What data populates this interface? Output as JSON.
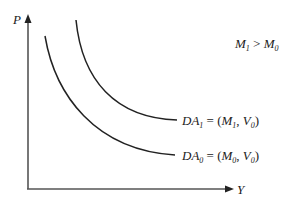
{
  "diagram": {
    "type": "aggregate-demand-shift",
    "axes": {
      "y_label": "P",
      "x_label": "Y"
    },
    "annotation": {
      "left_var": "M",
      "left_sub": "1",
      "relation": " > ",
      "right_var": "M",
      "right_sub": "0"
    },
    "curves": [
      {
        "id": "DA1",
        "name": "DA",
        "name_sub": "1",
        "eq": " = (",
        "m_var": "M",
        "m_sub": "1",
        "sep": ", ",
        "v_var": "V",
        "v_sub": "0",
        "close": ")"
      },
      {
        "id": "DA0",
        "name": "DA",
        "name_sub": "0",
        "eq": " = (",
        "m_var": "M",
        "m_sub": "0",
        "sep": ", ",
        "v_var": "V",
        "v_sub": "0",
        "close": ")"
      }
    ],
    "colors": {
      "axis": "#555555",
      "curve": "#222222",
      "text": "#222222"
    }
  }
}
